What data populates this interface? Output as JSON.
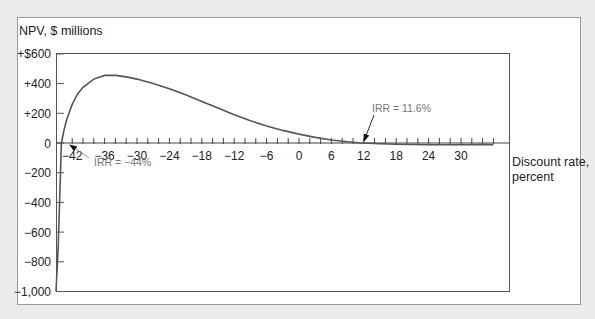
{
  "chart_data": {
    "type": "line",
    "title": "",
    "ylabel": "NPV, $ millions",
    "xlabel_line1": "Discount rate,",
    "xlabel_line2": "percent",
    "xlim": [
      -46,
      38
    ],
    "ylim": [
      -1000,
      600
    ],
    "x_tick_labels": [
      "-42",
      "-36",
      "-30",
      "-24",
      "-18",
      "-12",
      "-6",
      "0",
      "6",
      "12",
      "18",
      "24",
      "30"
    ],
    "x_tick_values": [
      -42,
      -36,
      -30,
      -24,
      -18,
      -12,
      -6,
      0,
      6,
      12,
      18,
      24,
      30
    ],
    "x_minor_tick_step": 2,
    "y_tick_labels": [
      "+$600",
      "+400",
      "+200",
      "0",
      "−200",
      "−400",
      "−600",
      "−800",
      "−1,000"
    ],
    "y_tick_values": [
      600,
      400,
      200,
      0,
      -200,
      -400,
      -600,
      -800,
      -1000
    ],
    "grid": false,
    "series": [
      {
        "name": "NPV",
        "x": [
          -45,
          -44.6,
          -44.3,
          -44,
          -43.5,
          -43,
          -42,
          -41,
          -40,
          -38,
          -36,
          -34,
          -32,
          -30,
          -27,
          -24,
          -21,
          -18,
          -15,
          -12,
          -9,
          -6,
          -3,
          0,
          3,
          6,
          9,
          11.6,
          15,
          18,
          21,
          24,
          27,
          30,
          33,
          36
        ],
        "values": [
          -1000,
          -700,
          -350,
          0,
          90,
          160,
          260,
          330,
          375,
          430,
          455,
          455,
          445,
          430,
          400,
          365,
          325,
          280,
          235,
          190,
          150,
          115,
          85,
          60,
          38,
          20,
          8,
          0,
          -5,
          -8,
          -10,
          -12,
          -12,
          -12,
          -11,
          -11
        ]
      }
    ],
    "annotations": [
      {
        "text": "IRR = −44%",
        "x": -44,
        "y": 0
      },
      {
        "text": "IRR = 11.6%",
        "x": 11.6,
        "y": 0
      }
    ]
  },
  "labels": {
    "ylabel": "NPV, $ millions",
    "xlabel_line1": "Discount rate,",
    "xlabel_line2": "percent",
    "irr_low": "IRR = −44%",
    "irr_high": "IRR = 11.6%"
  },
  "colors": {
    "background": "#ebebeb",
    "card": "#ffffff",
    "frame": "#9a9a9a",
    "axis": "#444444",
    "curve": "#555555",
    "annotation": "#777777"
  }
}
